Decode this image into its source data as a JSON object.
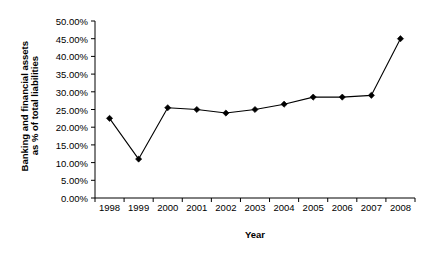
{
  "chart_data": {
    "type": "line",
    "title": "",
    "xlabel": "Year",
    "ylabel": "Banking and financial assets as % of total liabilities",
    "ylabel_lines": [
      "Banking and financial assets",
      "as % of total liabilities"
    ],
    "categories": [
      "1998",
      "1999",
      "2000",
      "2001",
      "2002",
      "2003",
      "2004",
      "2005",
      "2006",
      "2007",
      "2008"
    ],
    "values": [
      22.5,
      11.0,
      25.5,
      25.0,
      24.0,
      25.0,
      26.5,
      28.5,
      28.5,
      29.0,
      45.0
    ],
    "ylim": [
      0,
      50
    ],
    "ytick_values": [
      0,
      5,
      10,
      15,
      20,
      25,
      30,
      35,
      40,
      45,
      50
    ],
    "ytick_labels": [
      "0.00%",
      "5.00%",
      "10.00%",
      "15.00%",
      "20.00%",
      "25.00%",
      "30.00%",
      "35.00%",
      "40.00%",
      "45.00%",
      "50.00%"
    ],
    "xtick_labels": [
      "1998",
      "1999",
      "2000",
      "2001",
      "2002",
      "2003",
      "2004",
      "2005",
      "2006",
      "2007",
      "2008"
    ],
    "grid": false,
    "legend": "none",
    "series_color": "#000000",
    "marker": "diamond",
    "marker_color": "#000000",
    "axis_color": "#000000"
  }
}
